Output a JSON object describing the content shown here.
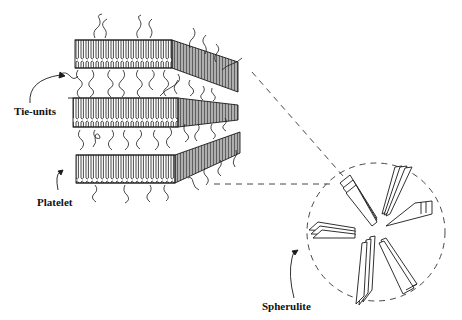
{
  "diagram": {
    "type": "schematic",
    "labels": {
      "tie_units": "Tie-units",
      "platelet": "Platelet",
      "spherulite": "Spherulite"
    },
    "elements": {
      "platelets": [
        {
          "name": "top-platelet",
          "flat": {
            "x1": 75,
            "x2": 172,
            "ytop": 40,
            "ybot": 68
          },
          "slant_end": {
            "x": 238,
            "ytop": 62,
            "ybot": 92
          }
        },
        {
          "name": "middle-platelet",
          "flat": {
            "x1": 73,
            "x2": 178,
            "ytop": 98,
            "ybot": 127
          },
          "slant_end": {
            "x": 238,
            "ytop": 105,
            "ybot": 120
          }
        },
        {
          "name": "bottom-platelet",
          "flat": {
            "x1": 76,
            "x2": 175,
            "ytop": 155,
            "ybot": 183
          },
          "slant_end": {
            "x": 240,
            "ytop": 132,
            "ybot": 153
          }
        }
      ],
      "spherulite": {
        "cx": 376,
        "cy": 232,
        "r": 69
      },
      "zoom_lines": [
        {
          "from": [
            250,
            70
          ],
          "to": [
            343,
            178
          ]
        },
        {
          "from": [
            214,
            184
          ],
          "to": [
            330,
            184
          ]
        }
      ]
    },
    "colors": {
      "ink": "#1a1a1a",
      "background": "#ffffff"
    }
  }
}
